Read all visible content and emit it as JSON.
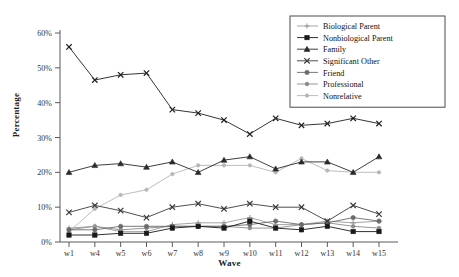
{
  "chart_data": {
    "type": "line",
    "title": "",
    "xlabel": "Wave",
    "ylabel": "Percentage",
    "categories": [
      "w1",
      "w4",
      "w5",
      "w6",
      "w7",
      "w8",
      "w9",
      "w10",
      "w11",
      "w12",
      "w13",
      "w14",
      "w15"
    ],
    "ylim": [
      0,
      60
    ],
    "ytick_labels": [
      "0%",
      "10%",
      "20%",
      "30%",
      "40%",
      "50%",
      "60%"
    ],
    "ytick_values": [
      0,
      10,
      20,
      30,
      40,
      50,
      60
    ],
    "grid": false,
    "legend_position": "top-right",
    "series": [
      {
        "name": "Biological Parent",
        "color": "#9a9a9a",
        "marker": "plus",
        "values": [
          4.0,
          4.5,
          3.0,
          3.0,
          5.0,
          5.5,
          5.5,
          7.0,
          5.0,
          5.0,
          6.0,
          5.5,
          6.0
        ]
      },
      {
        "name": "Nonbiological Parent",
        "color": "#1a1a1a",
        "marker": "square",
        "values": [
          2.0,
          2.0,
          2.5,
          2.5,
          4.0,
          4.5,
          4.0,
          6.0,
          4.0,
          3.5,
          4.5,
          3.0,
          3.0
        ]
      },
      {
        "name": "Family",
        "color": "#2a2a2a",
        "marker": "triangle",
        "values": [
          20.0,
          22.0,
          22.5,
          21.5,
          23.0,
          20.0,
          23.5,
          24.5,
          21.0,
          23.0,
          23.0,
          20.0,
          24.5
        ]
      },
      {
        "name": "Significant Other",
        "color": "#3a3a3a",
        "marker": "cross",
        "values": [
          8.5,
          10.5,
          9.0,
          7.0,
          10.0,
          11.0,
          9.5,
          11.0,
          10.0,
          10.0,
          6.0,
          10.5,
          8.0
        ]
      },
      {
        "name": "Friend",
        "color": "#6b6b6b",
        "marker": "circle",
        "values": [
          3.5,
          3.5,
          4.5,
          4.5,
          4.5,
          4.5,
          4.5,
          5.0,
          6.0,
          5.0,
          5.5,
          7.0,
          6.0
        ]
      },
      {
        "name": "Professional",
        "color": "#8a8a8a",
        "marker": "circle-small",
        "values": [
          3.5,
          4.5,
          3.5,
          4.0,
          4.5,
          4.5,
          4.5,
          4.0,
          4.0,
          5.0,
          5.5,
          4.5,
          4.0
        ]
      },
      {
        "name": "Nonrelative",
        "color": "#b5b5b5",
        "marker": "dot",
        "values": [
          3.0,
          9.5,
          13.5,
          15.0,
          19.5,
          22.0,
          22.0,
          22.0,
          20.0,
          24.0,
          20.5,
          20.0,
          20.0
        ]
      }
    ],
    "top_series_name": "Significant Other",
    "topline": {
      "name": "Significant Other Top",
      "color": "#1f1f1f",
      "marker": "cross",
      "values": [
        56.0,
        46.5,
        48.0,
        48.5,
        38.0,
        37.0,
        35.0,
        31.0,
        35.5,
        33.5,
        34.0,
        35.5,
        34.0
      ]
    }
  },
  "axis": {
    "y_title": "Percentage",
    "x_title": "Wave"
  },
  "legend": {
    "items": [
      {
        "label": "Biological Parent"
      },
      {
        "label": "Nonbiological Parent"
      },
      {
        "label": "Family"
      },
      {
        "label": "Significant Other"
      },
      {
        "label": "Friend"
      },
      {
        "label": "Professional"
      },
      {
        "label": "Nonrelative"
      }
    ]
  }
}
